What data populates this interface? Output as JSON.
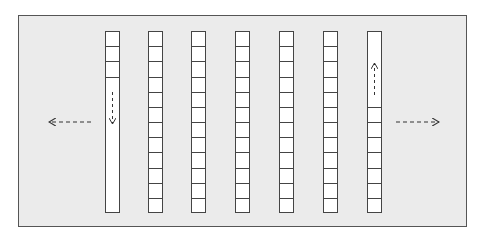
{
  "diagram": {
    "colors": {
      "background": "#ebebeb",
      "border": "#444444",
      "cell_fill": "#ffffff"
    },
    "columns": [
      {
        "x": 105,
        "filled_cells": 3,
        "empty_region": "bottom",
        "arrow": "down"
      },
      {
        "x": 148,
        "filled_cells": 12,
        "empty_region": "none",
        "arrow": "none"
      },
      {
        "x": 191,
        "filled_cells": 12,
        "empty_region": "none",
        "arrow": "none"
      },
      {
        "x": 235,
        "filled_cells": 12,
        "empty_region": "none",
        "arrow": "none"
      },
      {
        "x": 279,
        "filled_cells": 12,
        "empty_region": "none",
        "arrow": "none"
      },
      {
        "x": 323,
        "filled_cells": 12,
        "empty_region": "none",
        "arrow": "none"
      },
      {
        "x": 367,
        "filled_cells": 7,
        "empty_region": "top",
        "arrow": "up"
      }
    ],
    "total_cells_per_column": 12,
    "side_arrows": [
      {
        "direction": "left",
        "style": "dashed"
      },
      {
        "direction": "right",
        "style": "dashed"
      }
    ]
  }
}
